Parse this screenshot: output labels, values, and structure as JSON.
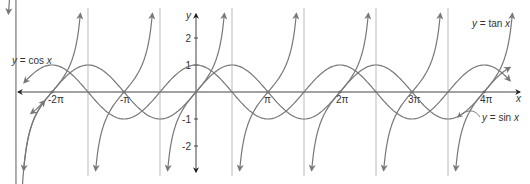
{
  "chart_data": {
    "type": "line",
    "title": "",
    "xlabel": "x",
    "ylabel": "y",
    "x_ticks": [
      {
        "value": -6.2832,
        "label": "-2π"
      },
      {
        "value": -3.1416,
        "label": "-π"
      },
      {
        "value": 3.1416,
        "label": "π"
      },
      {
        "value": 6.2832,
        "label": "2π"
      },
      {
        "value": 9.4248,
        "label": "3π"
      },
      {
        "value": 12.5664,
        "label": "4π"
      }
    ],
    "y_ticks": [
      {
        "value": 2,
        "label": "2"
      },
      {
        "value": 1,
        "label": "1"
      },
      {
        "value": -1,
        "label": "-1"
      },
      {
        "value": -2,
        "label": "-2"
      }
    ],
    "xlim": [
      -7.8,
      13.9
    ],
    "ylim": [
      -2.9,
      2.9
    ],
    "grid": false,
    "asymptotes": [
      -4.7124,
      -1.5708,
      1.5708,
      4.7124,
      7.854,
      10.9956
    ],
    "series": [
      {
        "name": "y = sin x",
        "function": "sin",
        "x_range": [
          -7.2,
          13.7
        ]
      },
      {
        "name": "y = cos x",
        "function": "cos",
        "x_range": [
          -7.5,
          13.7
        ]
      },
      {
        "name": "y = tan x",
        "function": "tan",
        "y_clip": [
          -2.9,
          2.9
        ]
      }
    ],
    "annotations": [
      {
        "text": "y = cos x",
        "x": 10,
        "y": 66
      },
      {
        "text": "y = tan x",
        "x": 472,
        "y": 27
      },
      {
        "text": "y = sin x",
        "x": 484,
        "y": 120
      }
    ]
  },
  "labels": {
    "x_axis": "x",
    "y_axis": "y",
    "cos": "y = cos x",
    "tan": "y = tan x",
    "sin": "y = sin x"
  }
}
